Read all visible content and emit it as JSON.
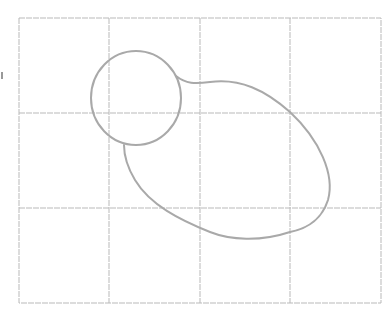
{
  "diagram": {
    "type": "grid with blob shape",
    "grid": {
      "columns": 4,
      "rows": 3,
      "x_lines": [
        19,
        109,
        200,
        290,
        381
      ],
      "y_lines": [
        18,
        113,
        208,
        303
      ],
      "color": "#b9b9b9"
    },
    "shapes": [
      {
        "name": "small-circle",
        "cx": 136,
        "cy": 98,
        "r": 46,
        "color": "#a9a9a9"
      },
      {
        "name": "blob-tail",
        "description": "large rounded lobe attached to circle's right and bottom",
        "color": "#a9a9a9"
      }
    ]
  }
}
